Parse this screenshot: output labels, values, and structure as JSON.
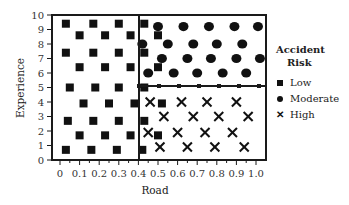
{
  "chart_data": {
    "type": "scatter",
    "title": "",
    "xlabel": "Road",
    "ylabel": "Experience",
    "xlim": [
      0,
      1.0
    ],
    "ylim": [
      0,
      10
    ],
    "x_ticks": [
      "0",
      "0.1",
      "0.2",
      "0.3",
      "0.4",
      "0.5",
      "0.6",
      "0.7",
      "0.8",
      "0.9",
      "1.0"
    ],
    "y_ticks": [
      "0",
      "1",
      "2",
      "3",
      "4",
      "5",
      "6",
      "7",
      "8",
      "9",
      "10"
    ],
    "grid": false,
    "legend_position": "right",
    "legend_title": [
      "Accident",
      "Risk"
    ],
    "regions": [
      {
        "label": "Low",
        "x_range": [
          0,
          0.4
        ],
        "y_range": [
          0,
          10
        ]
      },
      {
        "label": "Moderate",
        "x_range": [
          0.4,
          1.0
        ],
        "y_range": [
          5,
          10
        ]
      },
      {
        "label": "High",
        "x_range": [
          0.4,
          1.0
        ],
        "y_range": [
          0,
          5
        ]
      }
    ],
    "series": [
      {
        "name": "Low",
        "marker": "square",
        "points": [
          [
            0.03,
            9.4
          ],
          [
            0.17,
            9.4
          ],
          [
            0.3,
            9.4
          ],
          [
            0.43,
            9.4
          ],
          [
            0.1,
            8.6
          ],
          [
            0.23,
            8.6
          ],
          [
            0.36,
            8.6
          ],
          [
            0.5,
            8.6
          ],
          [
            0.03,
            7.4
          ],
          [
            0.17,
            7.4
          ],
          [
            0.3,
            7.4
          ],
          [
            0.43,
            7.4
          ],
          [
            0.1,
            6.4
          ],
          [
            0.23,
            6.4
          ],
          [
            0.36,
            6.4
          ],
          [
            0.5,
            6.4
          ],
          [
            0.05,
            5.0
          ],
          [
            0.18,
            5.0
          ],
          [
            0.3,
            5.0
          ],
          [
            0.43,
            5.0
          ],
          [
            0.12,
            3.9
          ],
          [
            0.25,
            3.9
          ],
          [
            0.38,
            3.9
          ],
          [
            0.52,
            3.9
          ],
          [
            0.04,
            2.7
          ],
          [
            0.17,
            2.7
          ],
          [
            0.3,
            2.7
          ],
          [
            0.43,
            2.7
          ],
          [
            0.1,
            1.7
          ],
          [
            0.23,
            1.7
          ],
          [
            0.36,
            1.7
          ],
          [
            0.5,
            1.7
          ],
          [
            0.03,
            0.7
          ],
          [
            0.16,
            0.7
          ],
          [
            0.29,
            0.7
          ],
          [
            0.42,
            0.7
          ]
        ]
      },
      {
        "name": "Moderate",
        "marker": "circle",
        "points": [
          [
            0.5,
            9.2
          ],
          [
            0.63,
            9.2
          ],
          [
            0.76,
            9.2
          ],
          [
            0.89,
            9.2
          ],
          [
            1.01,
            9.2
          ],
          [
            0.42,
            8.0
          ],
          [
            0.55,
            8.0
          ],
          [
            0.68,
            8.0
          ],
          [
            0.8,
            8.0
          ],
          [
            0.93,
            8.0
          ],
          [
            0.52,
            7.0
          ],
          [
            0.65,
            7.0
          ],
          [
            0.77,
            7.0
          ],
          [
            0.9,
            7.0
          ],
          [
            1.02,
            7.0
          ],
          [
            0.45,
            6.0
          ],
          [
            0.58,
            6.0
          ],
          [
            0.7,
            6.0
          ],
          [
            0.83,
            6.0
          ],
          [
            0.95,
            6.0
          ]
        ]
      },
      {
        "name": "High",
        "marker": "x",
        "points": [
          [
            0.46,
            4.0
          ],
          [
            0.62,
            4.0
          ],
          [
            0.75,
            4.0
          ],
          [
            0.9,
            4.0
          ],
          [
            0.53,
            3.0
          ],
          [
            0.68,
            3.0
          ],
          [
            0.81,
            3.0
          ],
          [
            0.96,
            3.0
          ],
          [
            0.45,
            1.9
          ],
          [
            0.6,
            1.9
          ],
          [
            0.74,
            1.9
          ],
          [
            0.88,
            1.9
          ],
          [
            0.51,
            0.9
          ],
          [
            0.65,
            0.9
          ],
          [
            0.79,
            0.9
          ],
          [
            0.94,
            0.9
          ]
        ]
      }
    ]
  },
  "legend": {
    "title_line1": "Accident",
    "title_line2": "Risk",
    "items": [
      {
        "label": "Low",
        "marker": "square"
      },
      {
        "label": "Moderate",
        "marker": "circle"
      },
      {
        "label": "High",
        "marker": "x"
      }
    ]
  },
  "colors": {
    "marker": "#111111",
    "frame": "#1a1a1a",
    "text": "#222222"
  }
}
